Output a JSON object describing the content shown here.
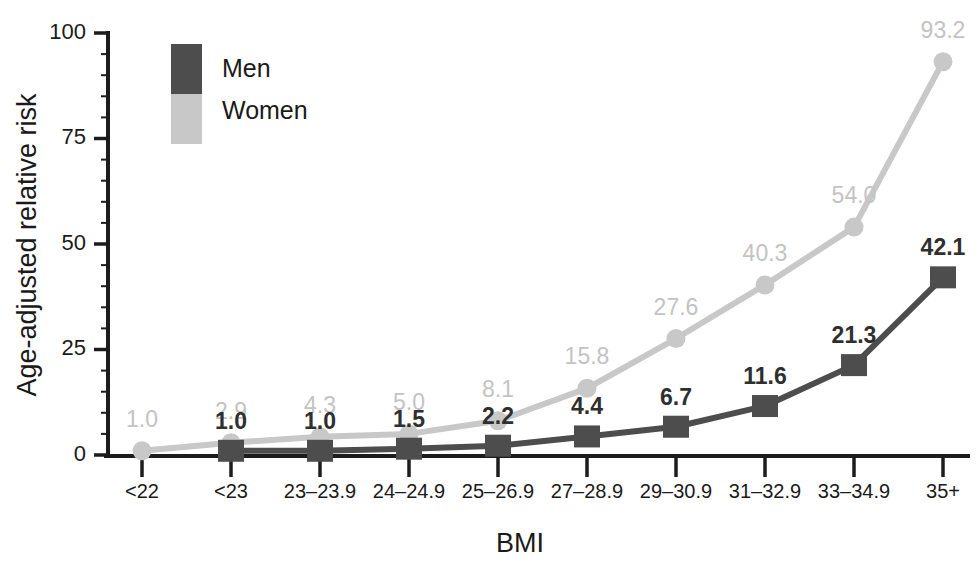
{
  "chart_data": {
    "type": "line",
    "title": "",
    "subtitle": "",
    "xlabel": "BMI",
    "ylabel": "Age-adjusted relative risk",
    "categories": [
      "<22",
      "<23",
      "23–23.9",
      "24–24.9",
      "25–26.9",
      "27–28.9",
      "29–30.9",
      "31–32.9",
      "33–34.9",
      "35+"
    ],
    "series": [
      {
        "name": "Men",
        "color": "#4d4d4d",
        "marker": "square",
        "values": [
          null,
          1.0,
          1.0,
          1.5,
          2.2,
          4.4,
          6.7,
          11.6,
          21.3,
          42.1
        ],
        "labels": [
          "",
          "1.0",
          "1.0",
          "1.5",
          "2.2",
          "4.4",
          "6.7",
          "11.6",
          "21.3",
          "42.1"
        ]
      },
      {
        "name": "Women",
        "color": "#c8c8c8",
        "marker": "circle",
        "values": [
          1.0,
          2.9,
          4.3,
          5.0,
          8.1,
          15.8,
          27.6,
          40.3,
          54.0,
          93.2
        ],
        "labels": [
          "1.0",
          "2.9",
          "4.3",
          "5.0",
          "8.1",
          "15.8",
          "27.6",
          "40.3",
          "54.0",
          "93.2"
        ]
      }
    ],
    "ylim": [
      0,
      100
    ],
    "yticks": [
      0,
      25,
      50,
      75,
      100
    ],
    "ytick_labels": [
      "0",
      "25",
      "50",
      "75",
      "100"
    ],
    "yminor_step": 5,
    "grid": false,
    "legend_position": "top-left-inside"
  },
  "legend": {
    "entries": [
      {
        "label": "Men",
        "color": "#4d4d4d"
      },
      {
        "label": "Women",
        "color": "#c8c8c8"
      }
    ]
  },
  "axes": {
    "x_title": "BMI",
    "y_title": "Age-adjusted relative risk",
    "axis_color": "#1c1c1c"
  }
}
